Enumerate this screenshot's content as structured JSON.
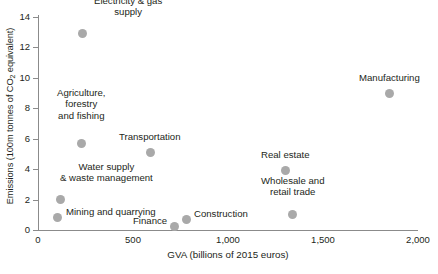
{
  "chart_data": {
    "type": "scatter",
    "title": "",
    "xlabel": "GVA (billions of 2015 euros)",
    "ylabel": "Emissions (100m tonnes of CO2 equivalent)",
    "ylabel_parts": {
      "pre": "Emissions (100m tonnes of CO",
      "sub": "2",
      "post": " equivalent)"
    },
    "xlim": [
      0,
      2000
    ],
    "ylim": [
      0,
      14
    ],
    "xticks": [
      0,
      500,
      1000,
      1500,
      2000
    ],
    "xtick_labels": [
      "0",
      "500",
      "1,000",
      "1,500",
      "2,000"
    ],
    "yticks": [
      0,
      2,
      4,
      6,
      8,
      10,
      12,
      14
    ],
    "ytick_labels": [
      "0",
      "2",
      "4",
      "6",
      "8",
      "10",
      "12",
      "14"
    ],
    "grid": false,
    "legend": "none",
    "marker_color": "#a9a9a9",
    "axis_color": "#8b8b8b",
    "points": [
      {
        "label": "Electricity & gas\nsupply",
        "x": 235,
        "y": 12.9,
        "label_align": "center",
        "label_dx": 45,
        "label_dy": -27
      },
      {
        "label": "Agriculture,\nforestry\nand fishing",
        "x": 230,
        "y": 5.7,
        "label_align": "center",
        "label_dx": 0,
        "label_dy": -39
      },
      {
        "label": "Transportation",
        "x": 590,
        "y": 5.1,
        "label_align": "center",
        "label_dx": 0,
        "label_dy": -16
      },
      {
        "label": "Water supply\n& waste management",
        "x": 120,
        "y": 2.0,
        "label_align": "center",
        "label_dx": 46,
        "label_dy": -27
      },
      {
        "label": "Mining and quarrying",
        "x": 105,
        "y": 0.8,
        "label_align": "left",
        "label_dx": 8,
        "label_dy": -6
      },
      {
        "label": "Finance",
        "x": 720,
        "y": 0.25,
        "label_align": "right",
        "label_dx": -8,
        "label_dy": -6
      },
      {
        "label": "Construction",
        "x": 780,
        "y": 0.7,
        "label_align": "left",
        "label_dx": 8,
        "label_dy": -6
      },
      {
        "label": "Real estate",
        "x": 1305,
        "y": 3.9,
        "label_align": "center",
        "label_dx": 0,
        "label_dy": -16
      },
      {
        "label": "Wholesale and\nretail trade",
        "x": 1340,
        "y": 1.0,
        "label_align": "center",
        "label_dx": 0,
        "label_dy": -28
      },
      {
        "label": "Manufacturing",
        "x": 1850,
        "y": 9.0,
        "label_align": "center",
        "label_dx": 0,
        "label_dy": -16
      }
    ]
  }
}
